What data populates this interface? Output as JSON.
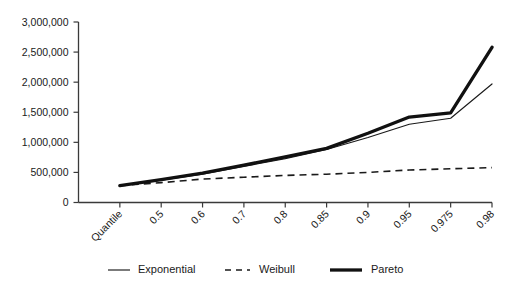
{
  "chart_data": {
    "type": "line",
    "title": "",
    "subtitle": "",
    "xlabel": "",
    "ylabel": "",
    "grid": false,
    "legend_position": "bottom",
    "categories": [
      "Quantile",
      "0.5",
      "0.6",
      "0.7",
      "0.8",
      "0.85",
      "0.9",
      "0.95",
      "0.975",
      "0.98"
    ],
    "ylim": [
      0,
      3000000
    ],
    "ytick_values": [
      0,
      500000,
      1000000,
      1500000,
      2000000,
      2500000,
      3000000
    ],
    "ytick_labels": [
      "0",
      "500,000",
      "1,000,000",
      "1,500,000",
      "2,000,000",
      "2,500,000",
      "3,000,000"
    ],
    "series": [
      {
        "name": "Exponential",
        "style": "solid-thin",
        "values": [
          280000,
          370000,
          470000,
          600000,
          730000,
          880000,
          1080000,
          1300000,
          1400000,
          1970000
        ]
      },
      {
        "name": "Weibull",
        "style": "dashed",
        "values": [
          280000,
          330000,
          390000,
          420000,
          450000,
          470000,
          500000,
          540000,
          560000,
          580000
        ]
      },
      {
        "name": "Pareto",
        "style": "solid-thick",
        "values": [
          280000,
          380000,
          490000,
          620000,
          760000,
          900000,
          1150000,
          1420000,
          1490000,
          2580000
        ]
      }
    ]
  },
  "legend": {
    "items": [
      {
        "label": "Exponential",
        "marker": "solid-thin-line"
      },
      {
        "label": "Weibull",
        "marker": "dashed-line"
      },
      {
        "label": "Pareto",
        "marker": "solid-thick-line"
      }
    ]
  }
}
